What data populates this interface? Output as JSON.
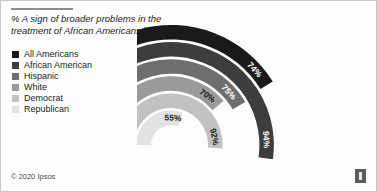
{
  "header": {
    "title": "% A sign of broader problems in the treatment of African Americans by police",
    "rule_icon": "horizontal-rule-icon"
  },
  "footer": {
    "copyright": "© 2020 Ipsos",
    "logo_icon": "ipsos-logo-icon"
  },
  "colors": {
    "s0": "#1a1a1a",
    "s1": "#3d3d3d",
    "s2": "#6e6e6e",
    "s3": "#9a9a9a",
    "s4": "#c2c2c2",
    "s5": "#e2e2e2",
    "background": "#fdfdfd",
    "separator": "#ffffff",
    "label_dark": "#ffffff",
    "label_light": "#1a1a1a"
  },
  "legend": {
    "items": [
      {
        "label": "All Americans",
        "color": "#1a1a1a"
      },
      {
        "label": "African American",
        "color": "#3d3d3d"
      },
      {
        "label": "Hispanic",
        "color": "#6e6e6e"
      },
      {
        "label": "White",
        "color": "#9a9a9a"
      },
      {
        "label": "Democrat",
        "color": "#c2c2c2"
      },
      {
        "label": "Republican",
        "color": "#e2e2e2"
      }
    ]
  },
  "chart_data": {
    "type": "bar",
    "subtype": "radial-concentric-arc",
    "title": "% A sign of broader problems in the treatment of African Americans by police",
    "xlabel": "",
    "ylabel": "",
    "categories": [
      "All Americans",
      "African American",
      "Hispanic",
      "White",
      "Democrat",
      "Republican"
    ],
    "values": [
      74,
      94,
      75,
      70,
      92,
      55
    ],
    "value_labels": [
      "74%",
      "92%",
      "75%",
      "70%",
      "94%",
      "55%"
    ],
    "series": [
      {
        "name": "A sign of broader problems in the treatment of African Americans by police",
        "values": [
          74,
          94,
          75,
          70,
          92,
          55
        ]
      }
    ],
    "points": [
      {
        "category": "All Americans",
        "value": 74,
        "label": "74%",
        "color": "#1a1a1a",
        "ring": 0
      },
      {
        "category": "African American",
        "value": 94,
        "label": "94%",
        "color": "#3d3d3d",
        "ring": 1
      },
      {
        "category": "Hispanic",
        "value": 75,
        "label": "75%",
        "color": "#6e6e6e",
        "ring": 2
      },
      {
        "category": "White",
        "value": 70,
        "label": "70%",
        "color": "#9a9a9a",
        "ring": 3
      },
      {
        "category": "Democrat",
        "value": 92,
        "label": "92%",
        "color": "#c2c2c2",
        "ring": 4
      },
      {
        "category": "Republican",
        "value": 55,
        "label": "55%",
        "color": "#e2e2e2",
        "ring": 5
      }
    ],
    "ylim": [
      0,
      100
    ],
    "grid": false,
    "legend_position": "left"
  }
}
